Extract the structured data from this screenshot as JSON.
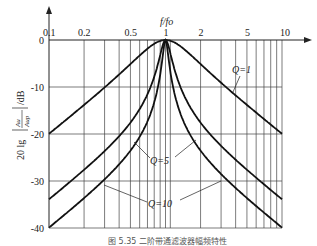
{
  "chart_data": {
    "type": "line",
    "title": "",
    "xlabel": "f/fo",
    "ylabel": "20lg|Au/Aup| /dB",
    "x_scale": "log",
    "xlim": [
      0.1,
      10
    ],
    "ylim": [
      -40,
      0
    ],
    "x_ticks": [
      "0.1",
      "0.2",
      "0.5",
      "1",
      "2",
      "5",
      "10"
    ],
    "y_ticks": [
      "0",
      "-10",
      "-20",
      "-30",
      "-40"
    ],
    "grid": true,
    "x": [
      0.1,
      0.2,
      0.3,
      0.5,
      0.7,
      0.8,
      0.9,
      1,
      1.1,
      1.25,
      1.5,
      2,
      3,
      5,
      7,
      10
    ],
    "series": [
      {
        "name": "Q=1",
        "values": [
          -20.0,
          -14.2,
          -10.9,
          -6.9,
          -3.4,
          -1.9,
          -0.5,
          0,
          -0.4,
          -1.4,
          -3.4,
          -6.9,
          -10.9,
          -14.2,
          -17.0,
          -20.0
        ]
      },
      {
        "name": "Q=5",
        "values": [
          -33.9,
          -27.6,
          -24.1,
          -17.5,
          -11.4,
          -8.1,
          -4.6,
          0,
          -4.1,
          -7.6,
          -11.4,
          -17.5,
          -24.1,
          -27.6,
          -31.0,
          -33.9
        ]
      },
      {
        "name": "Q=10",
        "values": [
          -39.9,
          -33.6,
          -30.0,
          -23.5,
          -17.2,
          -13.6,
          -9.7,
          0,
          -9.0,
          -13.1,
          -17.2,
          -23.5,
          -30.0,
          -33.6,
          -36.9,
          -39.9
        ]
      }
    ],
    "annotations": [
      "Q=1",
      "Q=5",
      "Q=10"
    ],
    "caption": "图 5.35 二阶带通滤波器幅频特性"
  },
  "labels": {
    "x_axis": "f/fo",
    "y_axis_prefix": "20 lg",
    "y_axis_frac_num": "Au",
    "y_axis_frac_den": "Aup",
    "y_axis_unit": "/dB",
    "q1": "Q=1",
    "q5": "Q=5",
    "q10": "Q=10",
    "caption": "图 5.35 二阶带通滤波器幅频特性"
  }
}
